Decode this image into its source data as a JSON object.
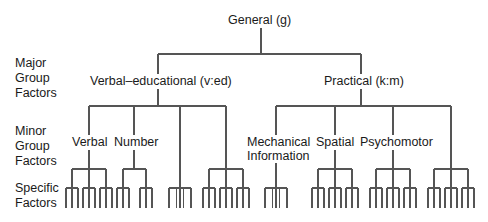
{
  "row_labels": {
    "major": [
      "Major",
      "Group",
      "Factors"
    ],
    "minor": [
      "Minor",
      "Group",
      "Factors"
    ],
    "specific": [
      "Specific",
      "Factors"
    ]
  },
  "nodes": {
    "general": "General (g)",
    "verbal_educational": "Verbal–educational (v:ed)",
    "practical": "Practical (k:m)",
    "verbal": "Verbal",
    "number": "Number",
    "mechanical_1": "Mechanical",
    "mechanical_2": "Information",
    "spatial": "Spatial",
    "psychomotor": "Psychomotor"
  },
  "tree": {
    "general_x": 261,
    "major": [
      {
        "name": "verbal_educational",
        "x": 158,
        "minor": [
          {
            "name": "verbal",
            "x": 89,
            "groups": [
              72,
              89,
              106
            ]
          },
          {
            "name": "number",
            "x": 134,
            "groups": [
              123,
              146
            ]
          },
          {
            "name": "unlabeled-1",
            "x": 180,
            "direct": true
          },
          {
            "name": "unlabeled-2",
            "x": 226,
            "groups": [
              209,
              226,
              243
            ]
          }
        ]
      },
      {
        "name": "practical",
        "x": 361,
        "minor": [
          {
            "name": "mechanical_information",
            "x": 276,
            "direct": true
          },
          {
            "name": "spatial",
            "x": 335,
            "groups": [
              318,
              335,
              352
            ]
          },
          {
            "name": "psychomotor",
            "x": 393,
            "groups": [
              376,
              393,
              410
            ]
          },
          {
            "name": "unlabeled-3",
            "x": 451,
            "groups": [
              434,
              451,
              468
            ]
          }
        ]
      }
    ]
  },
  "colors": {
    "line": "#555555",
    "text": "#1a1a1a",
    "background": "#ffffff"
  }
}
